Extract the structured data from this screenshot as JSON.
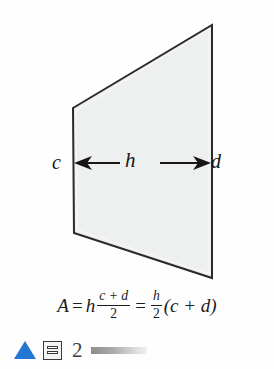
{
  "figure": {
    "shape_name": "trapezoid",
    "fill_color": "#eef0ef",
    "stroke_color": "#2b2b2b",
    "labels": {
      "left_side": "c",
      "right_side": "d",
      "width_arrow": "h"
    },
    "vertices": {
      "top_left": [
        73,
        108
      ],
      "top_right": [
        212,
        25
      ],
      "bottom_right": [
        212,
        278
      ],
      "bottom_left": [
        74,
        233
      ]
    },
    "arrow": {
      "y": 163,
      "x_start": 75,
      "x_end": 210,
      "heads": "both"
    }
  },
  "formula": {
    "area_symbol": "A",
    "equals": "=",
    "h": "h",
    "numerator": "c + d",
    "denominator": "2",
    "second_numerator": "h",
    "second_denominator": "2",
    "grouped_term": "(c + d)",
    "open_paren": "(",
    "close_paren": ")",
    "c": "c",
    "d": "d",
    "plus": "+",
    "plain_text": "A = h (c + d)/2 = h/2 (c + d)"
  },
  "footer": {
    "triangle_icon": "triangle-icon",
    "triangle_color": "#2277d4",
    "frame_icon": "frame-icon",
    "page_number": "2",
    "gradient_bar": "gradient-bar"
  }
}
